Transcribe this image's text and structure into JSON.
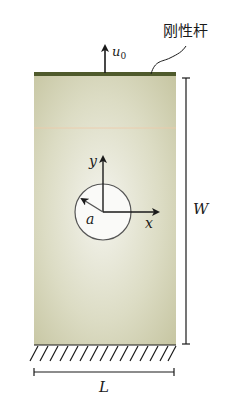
{
  "labels": {
    "rigid_rod": "刚性杆",
    "displacement": "u",
    "displacement_sub": "0",
    "axis_x": "x",
    "axis_y": "y",
    "radius": "a",
    "height": "W",
    "width": "L"
  },
  "colors": {
    "plate_center": "#f2f2ea",
    "plate_edge": "#c9c8a4",
    "rod": "#4f5a2c",
    "line": "#1a1a1a"
  }
}
